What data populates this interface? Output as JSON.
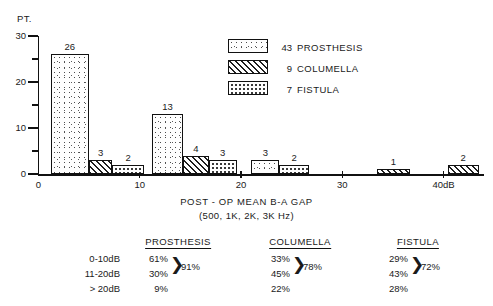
{
  "chart_data": {
    "type": "bar",
    "title": "",
    "xlabel": "POST - OP MEAN B-A GAP",
    "xlabel_sub": "(500, 1K, 2K, 3K Hz)",
    "ylabel": "PT.",
    "ylim": [
      0,
      30
    ],
    "xlim": [
      0,
      44
    ],
    "grid": false,
    "legend_position": "upper-right",
    "y_ticks_major": [
      "0",
      "10",
      "20",
      "30"
    ],
    "y_tick_values_major": [
      0,
      10,
      20,
      30
    ],
    "y_tick_values_minor": [
      5,
      15,
      25
    ],
    "x_ticks": [
      "0",
      "10",
      "20",
      "30",
      "40dB"
    ],
    "x_tick_values": [
      0,
      10,
      20,
      30,
      40
    ],
    "series": [
      {
        "name": "PROSTHESIS",
        "count": "43",
        "pattern": "speckle",
        "bars": [
          {
            "label": "26",
            "value": 26,
            "x_start": 1.2,
            "x_end": 5.0
          },
          {
            "label": "13",
            "value": 13,
            "x_start": 11.2,
            "x_end": 14.3
          },
          {
            "label": "3",
            "value": 3,
            "x_start": 21.0,
            "x_end": 23.8
          }
        ]
      },
      {
        "name": "COLUMELLA",
        "count": "9",
        "pattern": "diagonal-hatch",
        "bars": [
          {
            "label": "3",
            "value": 3,
            "x_start": 5.0,
            "x_end": 7.3
          },
          {
            "label": "4",
            "value": 4,
            "x_start": 14.3,
            "x_end": 16.8
          },
          {
            "label": "1",
            "value": 1,
            "x_start": 33.4,
            "x_end": 36.7
          },
          {
            "label": "2",
            "value": 2,
            "x_start": 40.4,
            "x_end": 43.5
          }
        ]
      },
      {
        "name": "FISTULA",
        "count": "7",
        "pattern": "dot-grid",
        "bars": [
          {
            "label": "2",
            "value": 2,
            "x_start": 7.3,
            "x_end": 10.4
          },
          {
            "label": "3",
            "value": 3,
            "x_start": 16.8,
            "x_end": 19.6
          },
          {
            "label": "2",
            "value": 2,
            "x_start": 23.8,
            "x_end": 26.7
          }
        ]
      }
    ]
  },
  "legend": {
    "items": [
      {
        "count": "43",
        "name": "PROSTHESIS"
      },
      {
        "count": "9",
        "name": "COLUMELLA"
      },
      {
        "count": "7",
        "name": "FISTULA"
      }
    ]
  },
  "summary_table": {
    "row_labels": [
      "0-10dB",
      "11-20dB",
      "> 20dB"
    ],
    "columns": [
      {
        "header": "PROSTHESIS",
        "values": [
          "61%",
          "30%",
          "9%"
        ],
        "group_total": "91%"
      },
      {
        "header": "COLUMELLA",
        "values": [
          "33%",
          "45%",
          "22%"
        ],
        "group_total": "78%"
      },
      {
        "header": "FISTULA",
        "values": [
          "29%",
          "43%",
          "28%"
        ],
        "group_total": "72%"
      }
    ]
  }
}
